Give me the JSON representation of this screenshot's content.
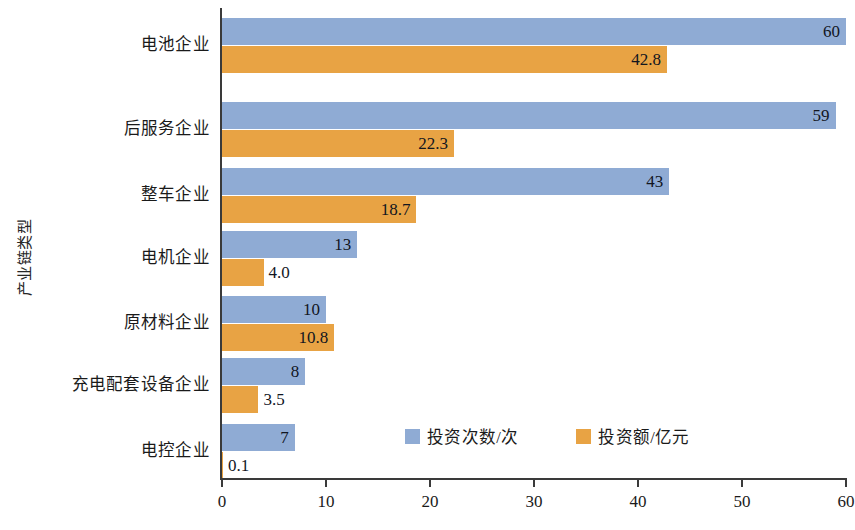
{
  "chart_data": {
    "type": "bar",
    "orientation": "horizontal",
    "title": "",
    "xlabel": "",
    "ylabel": "产业链类型",
    "xlim": [
      0,
      60
    ],
    "ticks": [
      0,
      10,
      20,
      30,
      40,
      50,
      60
    ],
    "tick_labels": [
      "0",
      "10",
      "20",
      "30",
      "40",
      "50",
      "60"
    ],
    "grid": false,
    "legend_position": "inside-bottom-center",
    "categories": [
      "电池企业",
      "后服务企业",
      "整车企业",
      "电机企业",
      "原材料企业",
      "充电配套设备企业",
      "电控企业"
    ],
    "series": [
      {
        "name": "投资次数/次",
        "color": "#8fabd4",
        "values": [
          60,
          59,
          43,
          13,
          10,
          8,
          7
        ],
        "value_labels": [
          "60",
          "59",
          "43",
          "13",
          "10",
          "8",
          "7"
        ]
      },
      {
        "name": "投资额/亿元",
        "color": "#e8a344",
        "values": [
          42.8,
          22.3,
          18.7,
          4.0,
          10.8,
          3.5,
          0.1
        ],
        "value_labels": [
          "42.8",
          "22.3",
          "18.7",
          "4.0",
          "10.8",
          "3.5",
          "0.1"
        ]
      }
    ]
  },
  "legend": {
    "items": [
      {
        "label": "投资次数/次",
        "color": "#8fabd4"
      },
      {
        "label": "投资额/亿元",
        "color": "#e8a344"
      }
    ]
  },
  "colors": {
    "series_blue": "#8fabd4",
    "series_orange": "#e8a344",
    "axis": "#3a3a3a",
    "text": "#1a1a1a",
    "background": "#ffffff"
  }
}
